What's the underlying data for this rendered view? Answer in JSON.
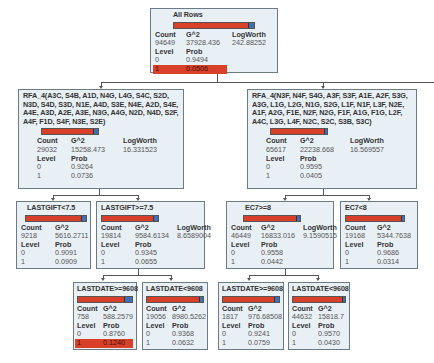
{
  "tree": {
    "root": {
      "title": "All Rows",
      "headers": {
        "count": "Count",
        "g2": "G^2",
        "logworth": "LogWorth",
        "level": "Level",
        "prob": "Prob"
      },
      "count": "94649",
      "g2": "37928.436",
      "logworth": "242.88252",
      "rows": [
        {
          "level": "0",
          "prob": "0.9494"
        },
        {
          "level": "1",
          "prob": "0.0506",
          "highlight": true
        }
      ]
    },
    "left": {
      "title": "RFA_4(A3C, S4B, A1D, N4G, L4G, S4C, S2D, N3D, S4D, S3D, N1E, A4D, S3E, N4E, A2D, S4E, A4E, A3D, A2E, A3E, N3G, A4G, N2D, N4D, S2F, A4F, F1D, S4F, N3E, S2E)",
      "count": "29032",
      "g2": "15258.473",
      "logworth": "16.331523",
      "rows": [
        {
          "level": "0",
          "prob": "0.9264"
        },
        {
          "level": "1",
          "prob": "0.0736"
        }
      ]
    },
    "right": {
      "title": "RFA_4(N3F, N4F, S4G, A3F, S3F, A1E, A2F, S3G, A3G, L1G, L2G, N1G, S2G, L1F, N1F, L3F, N2E, A1F, A2G, F1E, N2F, N2G, F1F, A1G, F1G, L2F, A4C, L3G, L4F, N2C, S2C, S3B, S3C)",
      "count": "65617",
      "g2": "22238.668",
      "logworth": "16.569557",
      "rows": [
        {
          "level": "0",
          "prob": "0.9595"
        },
        {
          "level": "1",
          "prob": "0.0405"
        }
      ]
    },
    "ll": {
      "title": "LASTGIFT<7.5",
      "count": "9218",
      "g2": "5616.2711",
      "rows": [
        {
          "level": "0",
          "prob": "0.9091"
        },
        {
          "level": "1",
          "prob": "0.0909"
        }
      ]
    },
    "lr": {
      "title": "LASTGIFT>=7.5",
      "count": "19814",
      "g2": "9584.6134",
      "logworth": "8.6589004",
      "rows": [
        {
          "level": "0",
          "prob": "0.9345"
        },
        {
          "level": "1",
          "prob": "0.0655"
        }
      ]
    },
    "rl": {
      "title": "EC7>=8",
      "count": "46449",
      "g2": "16833.016",
      "logworth": "9.1590515",
      "rows": [
        {
          "level": "0",
          "prob": "0.9558"
        },
        {
          "level": "1",
          "prob": "0.0442"
        }
      ]
    },
    "rr": {
      "title": "EC7<8",
      "count": "19168",
      "g2": "5344.7638",
      "rows": [
        {
          "level": "0",
          "prob": "0.9686"
        },
        {
          "level": "1",
          "prob": "0.0314"
        }
      ]
    },
    "lrl": {
      "title": "LASTDATE>=9608",
      "count": "758",
      "g2": "588.2579",
      "rows": [
        {
          "level": "0",
          "prob": "0.8760"
        },
        {
          "level": "1",
          "prob": "0.1240",
          "highlight": true
        }
      ]
    },
    "lrr": {
      "title": "LASTDATE<9608",
      "count": "19056",
      "g2": "8980.5262",
      "rows": [
        {
          "level": "0",
          "prob": "0.9368"
        },
        {
          "level": "1",
          "prob": "0.0632"
        }
      ]
    },
    "rll": {
      "title": "LASTDATE>=9608",
      "count": "1817",
      "g2": "976.68508",
      "rows": [
        {
          "level": "0",
          "prob": "0.9241"
        },
        {
          "level": "1",
          "prob": "0.0759"
        }
      ]
    },
    "rlr": {
      "title": "LASTDATE<9608",
      "count": "44632",
      "g2": "15818.7",
      "rows": [
        {
          "level": "0",
          "prob": "0.9570"
        },
        {
          "level": "1",
          "prob": "0.0430"
        }
      ]
    }
  },
  "colors": {
    "bar_red": "#d9402a",
    "bar_blue": "#3f6fb5",
    "node_bg": "#e9f0f5"
  }
}
